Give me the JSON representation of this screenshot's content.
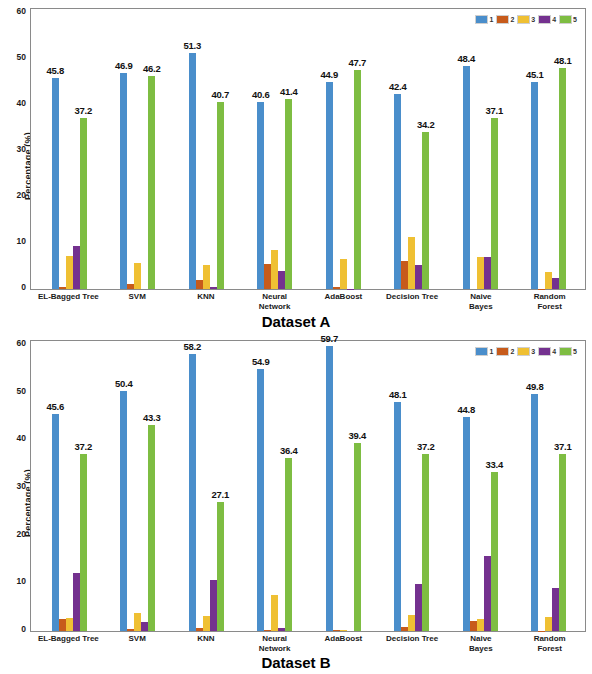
{
  "figure": {
    "ylabel": "Percentage (%)",
    "yticks": [
      0,
      10,
      20,
      30,
      40,
      50,
      60
    ],
    "ymin": 0,
    "ymax": 60,
    "series_colors": {
      "1": "#4a8ecb",
      "2": "#c75b1b",
      "3": "#efc033",
      "4": "#74318f",
      "5": "#7ebd42"
    },
    "legend": [
      {
        "label": "1",
        "color": "#4a8ecb"
      },
      {
        "label": "2",
        "color": "#c75b1b"
      },
      {
        "label": "3",
        "color": "#efc033"
      },
      {
        "label": "4",
        "color": "#74318f"
      },
      {
        "label": "5",
        "color": "#7ebd42"
      }
    ]
  },
  "chart_data": [
    {
      "type": "bar",
      "title": "Dataset A",
      "xlabel": "",
      "ylabel": "Percentage (%)",
      "ylim": [
        0,
        60
      ],
      "yticks": [
        0,
        10,
        20,
        30,
        40,
        50,
        60
      ],
      "grid": false,
      "legend_position": "top-right",
      "legend": [
        "1",
        "2",
        "3",
        "4",
        "5"
      ],
      "categories": [
        "EL-Bagged Tree",
        "SVM",
        "KNN",
        "Neural Network",
        "AdaBoost",
        "Decision Tree",
        "Naive Bayes",
        "Random Forest"
      ],
      "series": [
        {
          "name": "1",
          "color": "#4a8ecb",
          "values": [
            45.8,
            46.9,
            51.3,
            40.6,
            44.9,
            42.4,
            48.4,
            45.1
          ]
        },
        {
          "name": "2",
          "color": "#c75b1b",
          "values": [
            0.4,
            1.1,
            2.0,
            5.5,
            0.5,
            6.1,
            0.0,
            0.1
          ]
        },
        {
          "name": "3",
          "color": "#efc033",
          "values": [
            7.2,
            5.7,
            5.3,
            8.4,
            6.5,
            11.4,
            7.0,
            3.8
          ]
        },
        {
          "name": "4",
          "color": "#74318f",
          "values": [
            9.4,
            0.0,
            0.5,
            4.0,
            0.1,
            5.3,
            6.9,
            2.4
          ]
        },
        {
          "name": "5",
          "color": "#7ebd42",
          "values": [
            37.2,
            46.2,
            40.7,
            41.4,
            47.7,
            34.2,
            37.1,
            48.1
          ]
        }
      ],
      "data_labels": {
        "1": [
          "45.8",
          "46.9",
          "51.3",
          "40.6",
          "44.9",
          "42.4",
          "48.4",
          "45.1"
        ],
        "5": [
          "37.2",
          "46.2",
          "40.7",
          "41.4",
          "47.7",
          "34.2",
          "37.1",
          "48.1"
        ]
      }
    },
    {
      "type": "bar",
      "title": "Dataset B",
      "xlabel": "",
      "ylabel": "Percentage (%)",
      "ylim": [
        0,
        60
      ],
      "yticks": [
        0,
        10,
        20,
        30,
        40,
        50,
        60
      ],
      "grid": false,
      "legend_position": "top-right",
      "legend": [
        "1",
        "2",
        "3",
        "4",
        "5"
      ],
      "categories": [
        "EL-Bagged Tree",
        "SVM",
        "KNN",
        "Neural Network",
        "AdaBoost",
        "Decision Tree",
        "Naive Bayes",
        "Random Forest"
      ],
      "series": [
        {
          "name": "1",
          "color": "#4a8ecb",
          "values": [
            45.6,
            50.4,
            58.2,
            54.9,
            59.7,
            48.1,
            44.8,
            49.8
          ]
        },
        {
          "name": "2",
          "color": "#c75b1b",
          "values": [
            2.5,
            0.4,
            0.7,
            0.3,
            0.3,
            0.9,
            2.2,
            0.1
          ]
        },
        {
          "name": "3",
          "color": "#efc033",
          "values": [
            2.7,
            3.8,
            3.1,
            7.5,
            0.2,
            3.3,
            2.6,
            3.0
          ]
        },
        {
          "name": "4",
          "color": "#74318f",
          "values": [
            12.1,
            1.9,
            10.6,
            0.6,
            0.0,
            9.9,
            15.8,
            9.1
          ]
        },
        {
          "name": "5",
          "color": "#7ebd42",
          "values": [
            37.2,
            43.3,
            27.1,
            36.4,
            39.4,
            37.2,
            33.4,
            37.1
          ]
        }
      ],
      "data_labels": {
        "1": [
          "45.6",
          "50.4",
          "58.2",
          "54.9",
          "59.7",
          "48.1",
          "44.8",
          "49.8"
        ],
        "5": [
          "37.2",
          "43.3",
          "27.1",
          "36.4",
          "39.4",
          "37.2",
          "33.4",
          "37.1"
        ]
      }
    }
  ]
}
